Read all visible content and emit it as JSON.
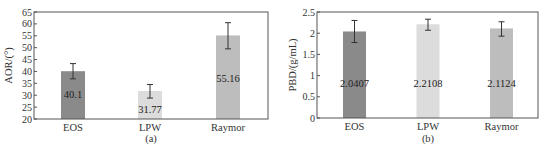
{
  "chart_data": [
    {
      "type": "bar",
      "title": "",
      "subtitle": "(a)",
      "xlabel": "",
      "ylabel": "AOR/(°)",
      "ylim": [
        20,
        65
      ],
      "yticks": [
        20,
        25,
        30,
        35,
        40,
        45,
        50,
        55,
        60,
        65
      ],
      "categories": [
        "EOS",
        "LPW",
        "Raymor"
      ],
      "values": [
        40.1,
        31.77,
        55.16
      ],
      "data_labels": [
        "40.1",
        "31.77",
        "55.16"
      ],
      "error_bars": [
        {
          "low": 36.9,
          "high": 43.3
        },
        {
          "low": 28.8,
          "high": 34.5
        },
        {
          "low": 49.5,
          "high": 60.5
        }
      ],
      "bar_colors": [
        "#8a8a8a",
        "#dcdcdc",
        "#bdbdbd"
      ],
      "grid": false,
      "legend": null
    },
    {
      "type": "bar",
      "title": "",
      "subtitle": "(b)",
      "xlabel": "",
      "ylabel": "PBD/(g/mL)",
      "ylim": [
        0,
        2.5
      ],
      "yticks": [
        0,
        0.5,
        1,
        1.5,
        2,
        2.5
      ],
      "categories": [
        "EOS",
        "LPW",
        "Raymor"
      ],
      "values": [
        2.0407,
        2.2108,
        2.1124
      ],
      "data_labels": [
        "2.0407",
        "2.2108",
        "2.1124"
      ],
      "error_bars": [
        {
          "low": 1.78,
          "high": 2.3
        },
        {
          "low": 2.07,
          "high": 2.33
        },
        {
          "low": 1.93,
          "high": 2.27
        }
      ],
      "bar_colors": [
        "#8a8a8a",
        "#dcdcdc",
        "#bdbdbd"
      ],
      "grid": false,
      "legend": null
    }
  ]
}
